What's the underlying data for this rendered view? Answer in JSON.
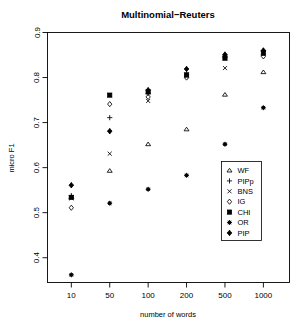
{
  "chart_data": {
    "type": "scatter",
    "title": "Multinomial−Reuters",
    "xlabel": "number of words",
    "ylabel": "micro F1",
    "grid": false,
    "legend_position": "bottom-right",
    "x_scale": "categorical-log",
    "categories": [
      "10",
      "50",
      "100",
      "200",
      "500",
      "1000"
    ],
    "xticks": [
      "10",
      "50",
      "100",
      "200",
      "500",
      "1000"
    ],
    "yticks": [
      "0.4",
      "0.5",
      "0.6",
      "0.7",
      "0.8",
      "0.9"
    ],
    "ylim": [
      0.345,
      0.9
    ],
    "series": [
      {
        "name": "WF",
        "marker": "triangle",
        "values": [
          0.535,
          0.593,
          0.652,
          0.685,
          0.762,
          0.812
        ]
      },
      {
        "name": "PIPp",
        "marker": "plus",
        "values": [
          0.538,
          0.711,
          0.765,
          0.806,
          0.848,
          0.859
        ]
      },
      {
        "name": "BNS",
        "marker": "cross",
        "values": [
          0.532,
          0.631,
          0.748,
          0.803,
          0.821,
          0.856
        ]
      },
      {
        "name": "IG",
        "marker": "diamond-open",
        "values": [
          0.511,
          0.741,
          0.757,
          0.8,
          0.845,
          0.847
        ]
      },
      {
        "name": "CHI",
        "marker": "square-filled",
        "values": [
          0.534,
          0.761,
          0.768,
          0.806,
          0.843,
          0.854
        ]
      },
      {
        "name": "OR",
        "marker": "asterisk",
        "values": [
          0.362,
          0.521,
          0.552,
          0.583,
          0.652,
          0.733
        ]
      },
      {
        "name": "PIP",
        "marker": "diamond-filled",
        "values": [
          0.561,
          0.681,
          0.772,
          0.819,
          0.851,
          0.86
        ]
      }
    ]
  },
  "legend": {
    "items": [
      {
        "label": "WF",
        "marker": "triangle"
      },
      {
        "label": "PIPp",
        "marker": "plus"
      },
      {
        "label": "BNS",
        "marker": "cross"
      },
      {
        "label": "IG",
        "marker": "diamond-open"
      },
      {
        "label": "CHI",
        "marker": "square-filled"
      },
      {
        "label": "OR",
        "marker": "asterisk"
      },
      {
        "label": "PIP",
        "marker": "diamond-filled"
      }
    ]
  },
  "colors": {
    "foreground": "#000000",
    "background": "#ffffff"
  }
}
